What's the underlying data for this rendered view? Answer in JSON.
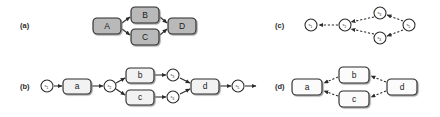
{
  "figure": {
    "background_color": "#ffffff",
    "stroke_color": "#2b2b2b",
    "gray_fill": "#b9b9b9",
    "light_fill": "#f2f2f2",
    "white_fill": "#fbfbfb"
  },
  "panels": [
    {
      "id": "a",
      "label": "(a)",
      "label_x": 20,
      "label_y": 28,
      "style": "solid-gray",
      "boxes": [
        {
          "name": "box-a-A",
          "text": "A",
          "x": 93,
          "y": 18,
          "w": 28,
          "h": 16,
          "fill": "#b9b9b9"
        },
        {
          "name": "box-a-B",
          "text": "B",
          "x": 131,
          "y": 7,
          "w": 28,
          "h": 16,
          "fill": "#b9b9b9"
        },
        {
          "name": "box-a-C",
          "text": "C",
          "x": 131,
          "y": 29,
          "w": 28,
          "h": 16,
          "fill": "#b9b9b9"
        },
        {
          "name": "box-a-D",
          "text": "D",
          "x": 168,
          "y": 18,
          "w": 28,
          "h": 16,
          "fill": "#b9b9b9"
        }
      ],
      "arrows": [
        {
          "name": "arrow-a-A-B",
          "x1": 122,
          "y1": 23,
          "x2": 130,
          "y2": 17,
          "dashed": false
        },
        {
          "name": "arrow-a-A-C",
          "x1": 122,
          "y1": 29,
          "x2": 130,
          "y2": 35,
          "dashed": false
        },
        {
          "name": "arrow-a-B-D",
          "x1": 160,
          "y1": 17,
          "x2": 167,
          "y2": 23,
          "dashed": false
        },
        {
          "name": "arrow-a-C-D",
          "x1": 160,
          "y1": 35,
          "x2": 167,
          "y2": 29,
          "dashed": false
        }
      ]
    },
    {
      "id": "b",
      "label": "(b)",
      "label_x": 20,
      "label_y": 89,
      "style": "solid-light",
      "boxes": [
        {
          "name": "box-b-a",
          "text": "a",
          "x": 63,
          "y": 79,
          "w": 28,
          "h": 15,
          "fill": "#f2f2f2"
        },
        {
          "name": "box-b-b",
          "text": "b",
          "x": 126,
          "y": 68,
          "w": 28,
          "h": 15,
          "fill": "#f2f2f2"
        },
        {
          "name": "box-b-c",
          "text": "c",
          "x": 126,
          "y": 90,
          "w": 28,
          "h": 15,
          "fill": "#f2f2f2"
        },
        {
          "name": "box-b-d",
          "text": "d",
          "x": 191,
          "y": 79,
          "w": 28,
          "h": 15,
          "fill": "#f2f2f2"
        }
      ],
      "nodes": [
        {
          "name": "node-b-s1",
          "base": "s",
          "sub": "1",
          "cx": 47,
          "cy": 86,
          "r": 6
        },
        {
          "name": "node-b-s2",
          "base": "s",
          "sub": "2",
          "cx": 110,
          "cy": 86,
          "r": 6
        },
        {
          "name": "node-b-s3",
          "base": "s",
          "sub": "3",
          "cx": 173,
          "cy": 75,
          "r": 6
        },
        {
          "name": "node-b-s4",
          "base": "s",
          "sub": "4",
          "cx": 173,
          "cy": 97,
          "r": 6
        },
        {
          "name": "node-b-s5",
          "base": "s",
          "sub": "5",
          "cx": 238,
          "cy": 86,
          "r": 6
        }
      ],
      "arrows": [
        {
          "name": "arrow-b-s1-a",
          "x1": 54,
          "y1": 86,
          "x2": 62,
          "y2": 86,
          "dashed": false
        },
        {
          "name": "arrow-b-a-s2",
          "x1": 92,
          "y1": 86,
          "x2": 103,
          "y2": 86,
          "dashed": false
        },
        {
          "name": "arrow-b-s2-b",
          "x1": 116,
          "y1": 83,
          "x2": 125,
          "y2": 78,
          "dashed": false
        },
        {
          "name": "arrow-b-s2-c",
          "x1": 116,
          "y1": 89,
          "x2": 125,
          "y2": 95,
          "dashed": false
        },
        {
          "name": "arrow-b-b-s3",
          "x1": 155,
          "y1": 75,
          "x2": 166,
          "y2": 75,
          "dashed": false
        },
        {
          "name": "arrow-b-c-s4",
          "x1": 155,
          "y1": 97,
          "x2": 166,
          "y2": 97,
          "dashed": false
        },
        {
          "name": "arrow-b-s3-d",
          "x1": 180,
          "y1": 78,
          "x2": 190,
          "y2": 83,
          "dashed": false
        },
        {
          "name": "arrow-b-s4-d",
          "x1": 180,
          "y1": 94,
          "x2": 190,
          "y2": 89,
          "dashed": false
        },
        {
          "name": "arrow-b-d-s5",
          "x1": 220,
          "y1": 86,
          "x2": 231,
          "y2": 86,
          "dashed": false
        },
        {
          "name": "arrow-b-s5-out",
          "x1": 245,
          "y1": 86,
          "x2": 256,
          "y2": 86,
          "dashed": false
        }
      ]
    },
    {
      "id": "c",
      "label": "(c)",
      "label_x": 275,
      "label_y": 28,
      "style": "dashed",
      "nodes": [
        {
          "name": "node-c-s1",
          "base": "s",
          "sub": "1",
          "cx": 311,
          "cy": 25,
          "r": 6
        },
        {
          "name": "node-c-s2",
          "base": "s",
          "sub": "2",
          "cx": 345,
          "cy": 25,
          "r": 6
        },
        {
          "name": "node-c-s3",
          "base": "s",
          "sub": "3",
          "cx": 380,
          "cy": 13,
          "r": 6
        },
        {
          "name": "node-c-s4",
          "base": "s",
          "sub": "4",
          "cx": 380,
          "cy": 38,
          "r": 6
        },
        {
          "name": "node-c-s5",
          "base": "s",
          "sub": "5",
          "cx": 409,
          "cy": 25,
          "r": 6
        }
      ],
      "arrows": [
        {
          "name": "arrow-c-s2-s1",
          "x1": 338,
          "y1": 25,
          "x2": 319,
          "y2": 25,
          "dashed": true
        },
        {
          "name": "arrow-c-s3-s2",
          "x1": 374,
          "y1": 17,
          "x2": 351,
          "y2": 22,
          "dashed": true
        },
        {
          "name": "arrow-c-s4-s2",
          "x1": 374,
          "y1": 34,
          "x2": 351,
          "y2": 29,
          "dashed": true
        },
        {
          "name": "arrow-c-s5-s3",
          "x1": 403,
          "y1": 21,
          "x2": 387,
          "y2": 15,
          "dashed": true
        },
        {
          "name": "arrow-c-s5-s4",
          "x1": 403,
          "y1": 30,
          "x2": 387,
          "y2": 36,
          "dashed": true
        }
      ]
    },
    {
      "id": "d",
      "label": "(d)",
      "label_x": 275,
      "label_y": 89,
      "style": "dashed",
      "boxes": [
        {
          "name": "box-d-a",
          "text": "a",
          "x": 292,
          "y": 79,
          "w": 30,
          "h": 16,
          "fill": "#fbfbfb"
        },
        {
          "name": "box-d-b",
          "text": "b",
          "x": 339,
          "y": 67,
          "w": 30,
          "h": 16,
          "fill": "#fbfbfb"
        },
        {
          "name": "box-d-c",
          "text": "c",
          "x": 339,
          "y": 91,
          "w": 30,
          "h": 16,
          "fill": "#fbfbfb"
        },
        {
          "name": "box-d-d",
          "text": "d",
          "x": 387,
          "y": 79,
          "w": 30,
          "h": 16,
          "fill": "#fbfbfb"
        }
      ],
      "arrows": [
        {
          "name": "arrow-d-b-a",
          "x1": 338,
          "y1": 77,
          "x2": 324,
          "y2": 83,
          "dashed": true
        },
        {
          "name": "arrow-d-c-a",
          "x1": 338,
          "y1": 96,
          "x2": 324,
          "y2": 91,
          "dashed": true
        },
        {
          "name": "arrow-d-d-b",
          "x1": 386,
          "y1": 82,
          "x2": 371,
          "y2": 76,
          "dashed": true
        },
        {
          "name": "arrow-d-d-c",
          "x1": 386,
          "y1": 91,
          "x2": 371,
          "y2": 97,
          "dashed": true
        }
      ]
    }
  ]
}
